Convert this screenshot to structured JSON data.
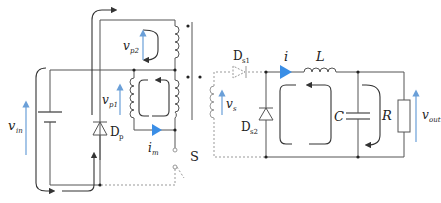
{
  "diagram": {
    "type": "two-switch-forward-converter-circuit",
    "colors": {
      "wire": "#555555",
      "loop_arrow": "#333333",
      "voltage_arrow": "#6a9fd8",
      "current_arrow": "#3a8ee6",
      "dashed": "#999999"
    },
    "labels": {
      "v_in": {
        "main": "v",
        "sub": "in"
      },
      "v_p1": {
        "main": "v",
        "sub": "p1"
      },
      "v_p2": {
        "main": "v",
        "sub": "p2"
      },
      "v_s": {
        "main": "v",
        "sub": "s"
      },
      "v_out": {
        "main": "v",
        "sub": "out"
      },
      "D_p": {
        "main": "D",
        "sub": "p"
      },
      "D_s1": {
        "main": "D",
        "sub": "s1"
      },
      "D_s2": {
        "main": "D",
        "sub": "s2"
      },
      "i_m": {
        "main": "i",
        "sub": "m"
      },
      "i": "i",
      "L": "L",
      "C": "C",
      "R": "R",
      "S": "S"
    },
    "components": [
      "DC source v_in",
      "Diode D_p",
      "Primary winding p1",
      "Primary winding p2",
      "Secondary winding s",
      "Switch S",
      "Diode D_s1",
      "Diode D_s2",
      "Inductor L",
      "Capacitor C",
      "Resistor R"
    ]
  }
}
